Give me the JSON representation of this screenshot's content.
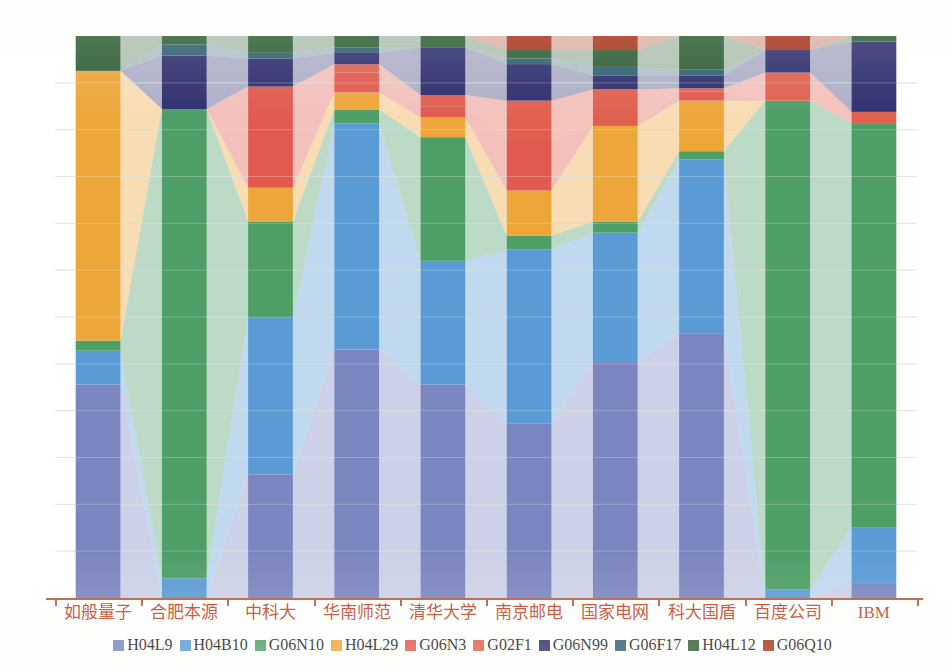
{
  "chart_data": {
    "type": "bar",
    "subtype": "stacked-percentage-with-ribbons",
    "title": "",
    "subtitle": "",
    "xlabel": "",
    "ylabel": "",
    "ylim": [
      0,
      100
    ],
    "grid": true,
    "legend_position": "bottom",
    "stacked": true,
    "normalized": true,
    "categories": [
      "如般量子",
      "合肥本源",
      "中科大",
      "华南师范",
      "清华大学",
      "南京邮电",
      "国家电网",
      "科大国盾",
      "百度公司",
      "IBM"
    ],
    "series": [
      {
        "name": "H04L9",
        "color": "#7b85bf",
        "values": [
          38.0,
          0.0,
          22.0,
          44.0,
          38.0,
          31.0,
          42.0,
          47.0,
          0.0,
          2.5
        ]
      },
      {
        "name": "H04B10",
        "color": "#5b9bd5",
        "values": [
          6.0,
          3.5,
          28.0,
          40.0,
          22.0,
          31.0,
          23.0,
          31.0,
          1.5,
          10.0
        ]
      },
      {
        "name": "G06N10",
        "color": "#4e9e68",
        "values": [
          1.8,
          83.5,
          17.0,
          2.5,
          22.0,
          2.5,
          2.0,
          1.5,
          87.0,
          72.0
        ]
      },
      {
        "name": "H04L29",
        "color": "#eda63a",
        "values": [
          48.0,
          0.0,
          6.0,
          3.0,
          3.5,
          8.0,
          17.0,
          9.0,
          0.0,
          0.0
        ]
      },
      {
        "name": "G06N3",
        "color": "#e05a4f",
        "values": [
          0.0,
          0.0,
          18.0,
          3.5,
          2.0,
          9.0,
          0.0,
          1.6,
          0.0,
          0.0
        ]
      },
      {
        "name": "G02F1",
        "color": "#e06050",
        "values": [
          0.0,
          0.0,
          0.0,
          1.5,
          2.0,
          7.0,
          6.5,
          0.6,
          5.0,
          2.0
        ]
      },
      {
        "name": "G06N99",
        "color": "#2e2f6e",
        "values": [
          0.0,
          9.5,
          5.0,
          2.0,
          8.5,
          6.5,
          2.5,
          2.3,
          4.0,
          12.5
        ]
      },
      {
        "name": "G06F17",
        "color": "#2f5f72",
        "values": [
          0.0,
          2.0,
          1.0,
          1.0,
          0.0,
          1.0,
          1.5,
          1.0,
          0.0,
          0.0
        ]
      },
      {
        "name": "H04L12",
        "color": "#2f5f36",
        "values": [
          6.2,
          1.5,
          3.0,
          2.0,
          2.0,
          1.5,
          3.0,
          6.0,
          0.0,
          1.0
        ]
      },
      {
        "name": "G06Q10",
        "color": "#a8371f",
        "values": [
          0.0,
          0.0,
          0.0,
          0.0,
          0.0,
          2.5,
          2.5,
          0.0,
          2.5,
          0.0
        ]
      }
    ],
    "ribbon_opacity": 0.38,
    "gridline_color": "#c9d4cf",
    "gridline_count": 12
  },
  "legend": {
    "items": [
      {
        "label": "H04L9",
        "color": "#7b85bf"
      },
      {
        "label": "H04B10",
        "color": "#5b9bd5"
      },
      {
        "label": "G06N10",
        "color": "#4e9e68"
      },
      {
        "label": "H04L29",
        "color": "#eda63a"
      },
      {
        "label": "G06N3",
        "color": "#e05a4f"
      },
      {
        "label": "G02F1",
        "color": "#e06050"
      },
      {
        "label": "G06N99",
        "color": "#2e2f6e"
      },
      {
        "label": "G06F17",
        "color": "#2f5f72"
      },
      {
        "label": "H04L12",
        "color": "#2f5f36"
      },
      {
        "label": "G06Q10",
        "color": "#a8371f"
      }
    ]
  },
  "axis": {
    "label_color": "#c0492c",
    "line_color": "#b8603f"
  }
}
